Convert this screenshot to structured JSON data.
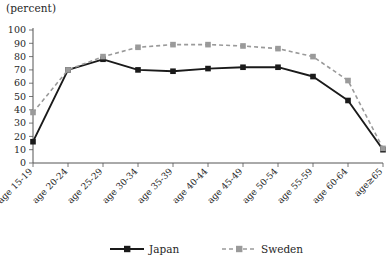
{
  "chart_data": {
    "type": "line",
    "title": "",
    "unit_label": "(percent)",
    "xlabel": "",
    "ylabel": "",
    "ylim": [
      0,
      100
    ],
    "ytick_step": 10,
    "yticks": [
      0,
      10,
      20,
      30,
      40,
      50,
      60,
      70,
      80,
      90,
      100
    ],
    "grid": false,
    "legend_position": "bottom",
    "categories": [
      "age 15-19",
      "age 20-24",
      "age 25-29",
      "age 30-34",
      "age 35-39",
      "age 40-44",
      "age 45-49",
      "age 50-54",
      "age 55-59",
      "age 60-64",
      "age≥65"
    ],
    "series": [
      {
        "name": "Japan",
        "color": "#1a1a1a",
        "style": "solid",
        "marker": "square",
        "values": [
          16,
          70,
          78,
          70,
          69,
          71,
          72,
          72,
          65,
          47,
          10
        ]
      },
      {
        "name": "Sweden",
        "color": "#9a9a9a",
        "style": "dashed",
        "marker": "square",
        "values": [
          38,
          70,
          80,
          87,
          89,
          89,
          88,
          86,
          80,
          62,
          11
        ]
      }
    ]
  },
  "legend": {
    "items": [
      {
        "label": "Japan"
      },
      {
        "label": "Sweden"
      }
    ]
  }
}
